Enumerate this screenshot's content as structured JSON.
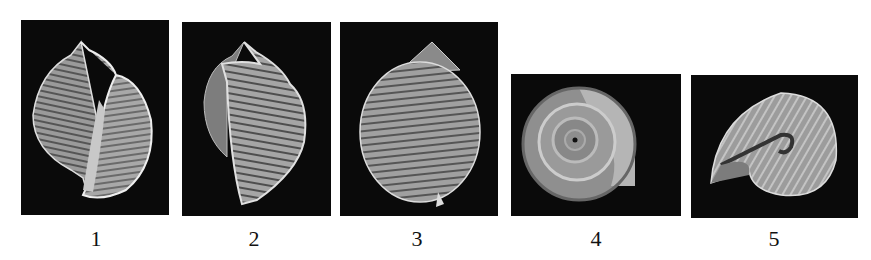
{
  "figure": {
    "background": "#ffffff",
    "panel_background": "#0a0a0a",
    "panels": [
      {
        "label": "1",
        "subject": "shell-apertural-view"
      },
      {
        "label": "2",
        "subject": "shell-lateral-view"
      },
      {
        "label": "3",
        "subject": "shell-abapertural-view"
      },
      {
        "label": "4",
        "subject": "shell-apical-view"
      },
      {
        "label": "5",
        "subject": "shell-umbilical-view"
      }
    ]
  }
}
